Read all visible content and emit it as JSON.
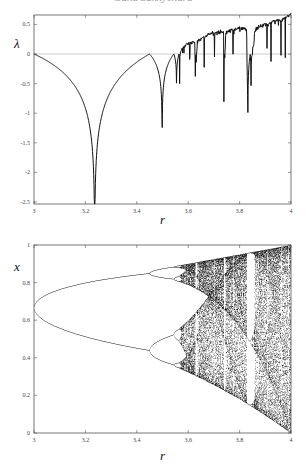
{
  "header": {
    "text": "Guna Sukhyendra"
  },
  "chart_data": [
    {
      "type": "line",
      "title": "",
      "xlabel": "r",
      "ylabel": "λ",
      "xlim": [
        3,
        4
      ],
      "ylim": [
        -2.55,
        0.7
      ],
      "x_ticks": [
        "3",
        "3.2",
        "3.4",
        "3.6",
        "3.8",
        "4"
      ],
      "y_ticks": [
        "0.5",
        "0",
        "-0.5",
        "-1",
        "-1.5",
        "-2",
        "-2.5"
      ],
      "grid": false,
      "reference_line": {
        "y": 0,
        "color": "#9a9a9a"
      },
      "series": [
        {
          "name": "Lyapunov exponent of logistic map",
          "description": "λ(r) for x_{n+1}=r·x_n(1-x_n); 0 at r=3, deep dip to about -2.5 at r≈3.236 (superstable), back to 0 at r≈3.449, dip to ≈-0.95 at r≈3.498, chaotic region above r≈3.57 rising to ≈0.69 at r=4, with periodic-window dips (largest ≈-1.35 near r≈3.83)",
          "key_points": [
            {
              "r": 3.0,
              "lambda": 0.0
            },
            {
              "r": 3.1,
              "lambda": -0.35
            },
            {
              "r": 3.2,
              "lambda": -1.1
            },
            {
              "r": 3.236,
              "lambda": -2.55
            },
            {
              "r": 3.3,
              "lambda": -0.75
            },
            {
              "r": 3.4,
              "lambda": -0.22
            },
            {
              "r": 3.449,
              "lambda": 0.0
            },
            {
              "r": 3.498,
              "lambda": -0.95
            },
            {
              "r": 3.544,
              "lambda": 0.0
            },
            {
              "r": 3.555,
              "lambda": -0.35
            },
            {
              "r": 3.6,
              "lambda": 0.18
            },
            {
              "r": 3.627,
              "lambda": -0.45
            },
            {
              "r": 3.7,
              "lambda": 0.35
            },
            {
              "r": 3.739,
              "lambda": -0.28
            },
            {
              "r": 3.8,
              "lambda": 0.45
            },
            {
              "r": 3.831,
              "lambda": -1.35
            },
            {
              "r": 3.9,
              "lambda": 0.5
            },
            {
              "r": 4.0,
              "lambda": 0.69
            }
          ]
        }
      ]
    },
    {
      "type": "scatter",
      "title": "",
      "xlabel": "r",
      "ylabel": "x",
      "xlim": [
        3,
        4
      ],
      "ylim": [
        0,
        1
      ],
      "x_ticks": [
        "3",
        "3.2",
        "3.4",
        "3.6",
        "3.8",
        "4"
      ],
      "y_ticks": [
        "1",
        "0.8",
        "0.6",
        "0.4",
        "0.2",
        "0"
      ],
      "grid": false,
      "series": [
        {
          "name": "Bifurcation diagram of logistic map",
          "description": "Attractor points x for r in [3,4]: period-2 branches from x≈0.667 at r=3 splitting to ≈0.85 and ≈0.44 at r≈3.449, period-4 then period-8 near r≈3.54–3.56, chaos from r≈3.57, periodic windows near r≈3.63, 3.74 and the wide period-3 window near r≈3.83–3.86; at r=4 fills 0..1",
          "key_points": [
            {
              "r": 3.0,
              "x": [
                0.667
              ]
            },
            {
              "r": 3.2,
              "x": [
                0.513,
                0.799
              ]
            },
            {
              "r": 3.449,
              "x": [
                0.44,
                0.85
              ]
            },
            {
              "r": 3.5,
              "x": [
                0.383,
                0.501,
                0.827,
                0.875
              ]
            },
            {
              "r": 4.0,
              "x": [
                0.0,
                1.0
              ]
            }
          ]
        }
      ]
    }
  ]
}
